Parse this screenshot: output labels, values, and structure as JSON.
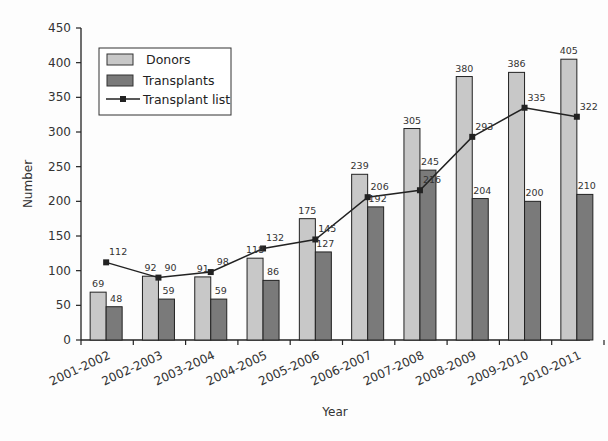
{
  "chart_data": {
    "type": "bar",
    "title": "",
    "xlabel": "Year",
    "ylabel": "Number",
    "ylim": [
      0,
      450
    ],
    "yticks": [
      0,
      50,
      100,
      150,
      200,
      250,
      300,
      350,
      400,
      450
    ],
    "grid": false,
    "legend_position": "upper-left",
    "categories": [
      "2001-2002",
      "2002-2003",
      "2003-2004",
      "2004-2005",
      "2005-2006",
      "2006-2007",
      "2007-2008",
      "2008-2009",
      "2009-2010",
      "2010-2011"
    ],
    "series": [
      {
        "name": "Donors",
        "type": "bar",
        "color": "#c8c8c8",
        "values": [
          69,
          92,
          91,
          118,
          175,
          239,
          305,
          380,
          386,
          405
        ]
      },
      {
        "name": "Transplants",
        "type": "bar",
        "color": "#7a7a7a",
        "values": [
          48,
          59,
          59,
          86,
          127,
          192,
          245,
          204,
          200,
          210
        ]
      },
      {
        "name": "Transplant list",
        "type": "line",
        "color": "#222222",
        "marker": "square",
        "values": [
          112,
          90,
          98,
          132,
          145,
          206,
          216,
          293,
          335,
          322
        ]
      }
    ]
  },
  "legend": {
    "items": [
      {
        "label": "Donors"
      },
      {
        "label": "Transplants"
      },
      {
        "label": "Transplant list"
      }
    ]
  },
  "axes": {
    "xlabel": "Year",
    "ylabel": "Number"
  }
}
